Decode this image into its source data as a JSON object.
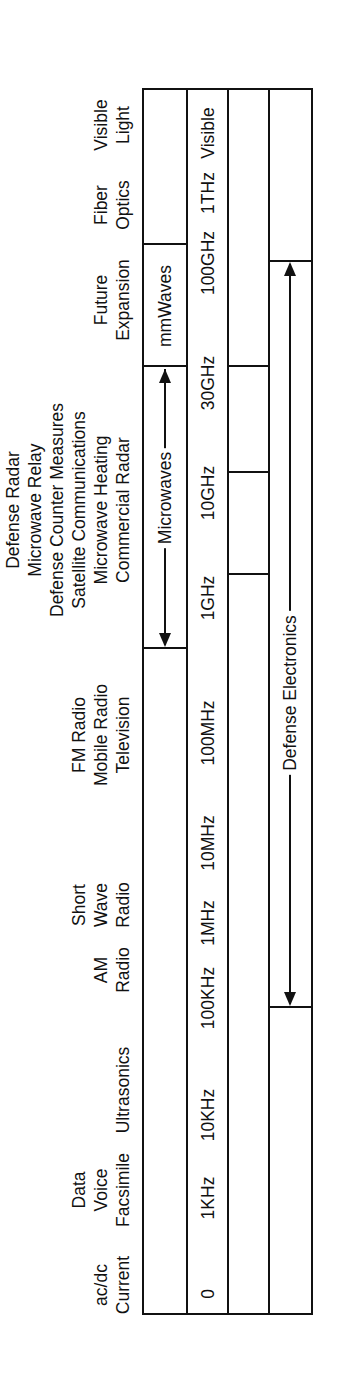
{
  "diagram": {
    "orientation": "rotated-90-ccw",
    "header_labels": [
      {
        "lines": [
          "ac/dc",
          "Current"
        ],
        "u": 106
      },
      {
        "lines": [
          "Data",
          "Voice",
          "Facsimile"
        ],
        "u": 201
      },
      {
        "lines": [
          "Ultrasonics"
        ],
        "u": 301
      },
      {
        "lines": [
          "AM",
          "Radio"
        ],
        "u": 421
      },
      {
        "lines": [
          "Short",
          "Wave",
          "Radio"
        ],
        "u": 486
      },
      {
        "lines": [
          "FM Radio",
          "Mobile Radio",
          "Television"
        ],
        "u": 656
      },
      {
        "lines": [
          "Defense Radar",
          "Microwave Relay",
          "Defense Counter Measures",
          "Satellite Communications",
          "Microwave Heating",
          "Commercial Radar"
        ],
        "u": 881
      },
      {
        "lines": [
          "Future",
          "Expansion"
        ],
        "u": 1091
      },
      {
        "lines": [
          "Fiber",
          "Optics"
        ],
        "u": 1186
      },
      {
        "lines": [
          "Visible",
          "Light"
        ],
        "u": 1266
      }
    ],
    "bands_row": {
      "mmwaves_label": "mmWaves",
      "microwaves_label": "Microwaves"
    },
    "frequency_scale": [
      {
        "label": "0",
        "u": 95
      },
      {
        "label": "1KHz",
        "u": 191
      },
      {
        "label": "10KHz",
        "u": 274
      },
      {
        "label": "100KHz",
        "u": 391
      },
      {
        "label": "1MHz",
        "u": 466
      },
      {
        "label": "10MHz",
        "u": 546
      },
      {
        "label": "100MHz",
        "u": 656
      },
      {
        "label": "1GHz",
        "u": 791
      },
      {
        "label": "10GHz",
        "u": 896
      },
      {
        "label": "30GHz",
        "u": 1006
      },
      {
        "label": "100GHz",
        "u": 1126
      },
      {
        "label": "1THz",
        "u": 1196
      },
      {
        "label": "Visible",
        "u": 1256
      }
    ],
    "defense_row": {
      "label": "Defense Electronics"
    }
  }
}
